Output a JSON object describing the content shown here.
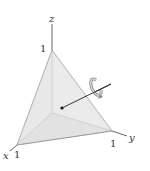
{
  "diagram": {
    "type": "3d-tetrahedron-with-normal-and-circulation",
    "axes": {
      "x": {
        "label": "x",
        "tick": "1"
      },
      "y": {
        "label": "y",
        "tick": "1"
      },
      "z": {
        "label": "z",
        "tick": "1"
      }
    },
    "vertices": [
      {
        "name": "x-intercept",
        "coords": "(1,0,0)"
      },
      {
        "name": "y-intercept",
        "coords": "(0,1,0)"
      },
      {
        "name": "z-intercept",
        "coords": "(0,0,1)"
      }
    ],
    "annotations": {
      "normal_vector": "outward normal to slanted face x+y+z=1",
      "circulation_arrow": "counterclockwise rotation about normal"
    },
    "colors": {
      "face_front": "#e6e6e6",
      "face_left": "#d2d2d2",
      "face_bottom": "#bdbdbd",
      "axis": "#555555",
      "vector": "#222222",
      "curl": "#9a9a9a"
    }
  }
}
